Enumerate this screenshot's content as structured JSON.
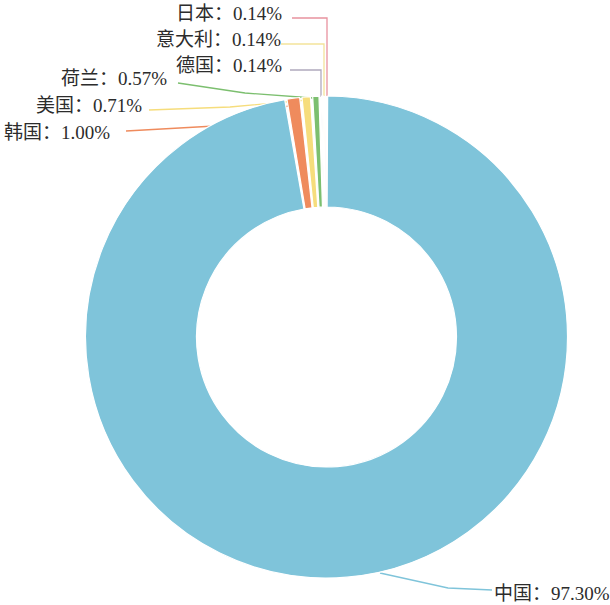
{
  "chart_data": {
    "type": "pie",
    "variant": "donut",
    "title": "",
    "subtitle": "",
    "xlabel": "",
    "ylabel": "",
    "legend_position": "none",
    "grid": false,
    "value_unit": "%",
    "label_format": "{name}：{value}%",
    "categories": [
      "中国",
      "韩国",
      "美国",
      "荷兰",
      "德国",
      "意大利",
      "日本"
    ],
    "values": [
      97.3,
      1.0,
      0.71,
      0.57,
      0.14,
      0.14,
      0.14
    ],
    "colors": [
      "#7fc4da",
      "#ef8b5d",
      "#f6dd7c",
      "#7cbf6f",
      "#b0a9bd",
      "#f3e39a",
      "#e8929f"
    ],
    "slices": [
      {
        "name": "中国",
        "value": 97.3,
        "label": "中国：97.30%",
        "color": "#7fc4da",
        "leader_color": "#7fc4da"
      },
      {
        "name": "韩国",
        "value": 1.0,
        "label": "韩国：1.00%",
        "color": "#ef8b5d",
        "leader_color": "#ef8b5d"
      },
      {
        "name": "美国",
        "value": 0.71,
        "label": "美国：0.71%",
        "color": "#f6dd7c",
        "leader_color": "#f6dd7c"
      },
      {
        "name": "荷兰",
        "value": 0.57,
        "label": "荷兰：0.57%",
        "color": "#7cbf6f",
        "leader_color": "#7cbf6f"
      },
      {
        "name": "德国",
        "value": 0.14,
        "label": "德国：0.14%",
        "color": "#b0a9bd",
        "leader_color": "#b0a9bd"
      },
      {
        "name": "意大利",
        "value": 0.14,
        "label": "意大利：0.14%",
        "color": "#f3e39a",
        "leader_color": "#f3e39a"
      },
      {
        "name": "日本",
        "value": 0.14,
        "label": "日本：0.14%",
        "color": "#e8929f",
        "leader_color": "#e8929f"
      }
    ]
  },
  "labels": {
    "japan": "日本：0.14%",
    "italy": "意大利：0.14%",
    "germany": "德国：0.14%",
    "netherlands": "荷兰：0.57%",
    "usa": "美国：0.71%",
    "korea": "韩国：1.00%",
    "china": "中国：97.30%"
  }
}
